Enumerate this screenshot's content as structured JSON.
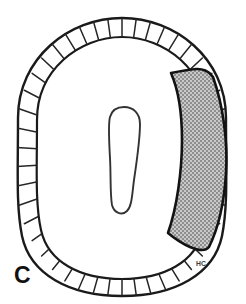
{
  "figure": {
    "panel_label": "C",
    "signature_mark": "HC",
    "colors": {
      "outline": "#1a1a1a",
      "background": "#ffffff",
      "shaded_sector_fill": "#a8a8a8",
      "segment_line": "#222222",
      "label_text": "#111111",
      "signature_text": "#3a3a3a"
    },
    "geometry": {
      "outer_ring": {
        "shape": "rounded-oval",
        "left": 18,
        "top": 18,
        "right": 228,
        "bottom": 296,
        "center_x": 122,
        "center_y": 157,
        "radius_x": 104,
        "radius_y": 139
      },
      "inner_ring": {
        "shape": "rounded-oval",
        "center_x": 122,
        "center_y": 157,
        "radius_x": 85,
        "radius_y": 120
      },
      "central_opening": {
        "shape": "elongated-vertical-oval",
        "left": 108,
        "top": 107,
        "right": 141,
        "bottom": 213,
        "center_x": 124,
        "center_y": 160
      },
      "segment_count": 46,
      "band_width_px": 19,
      "shaded_sector": {
        "start_angle_deg": -58,
        "end_angle_deg": 58,
        "side": "right"
      }
    },
    "stipple": {
      "pattern": "fine-checkerboard",
      "cell_px": 2,
      "dark": "#8d8d8d",
      "light": "#c8c8c8"
    }
  }
}
